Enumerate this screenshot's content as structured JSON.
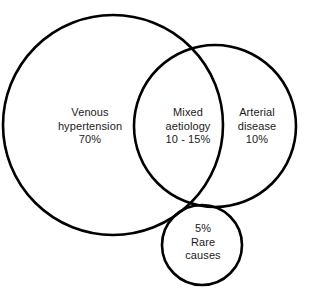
{
  "diagram": {
    "type": "venn",
    "background_color": "#ffffff",
    "stroke_color": "#000000",
    "text_color": "#1a1a1a",
    "sets": [
      {
        "id": "venous",
        "name": "venous-hypertension-circle",
        "lines": [
          "Venous",
          "hypertension",
          "70%"
        ],
        "line1": "Venous",
        "line2": "hypertension",
        "line3": "70%",
        "value": "70%",
        "cx": 113,
        "cy": 125,
        "r": 110
      },
      {
        "id": "arterial",
        "name": "arterial-disease-circle",
        "lines": [
          "Arterial",
          "disease",
          "10%"
        ],
        "line1": "Arterial",
        "line2": "disease",
        "line3": "10%",
        "value": "10%",
        "cx": 215,
        "cy": 126,
        "r": 81
      },
      {
        "id": "rare",
        "name": "rare-causes-circle",
        "lines": [
          "5%",
          "Rare",
          "causes"
        ],
        "line1": "5%",
        "line2": "Rare",
        "line3": "causes",
        "value": "5%",
        "cx": 202,
        "cy": 245,
        "r": 40
      }
    ],
    "intersections": [
      {
        "id": "mixed",
        "name": "mixed-aetiology-region",
        "between": [
          "venous",
          "arterial"
        ],
        "lines": [
          "Mixed",
          "aetiology",
          "10 - 15%"
        ],
        "line1": "Mixed",
        "line2": "aetiology",
        "line3": "10 - 15%",
        "value": "10 - 15%"
      }
    ]
  }
}
